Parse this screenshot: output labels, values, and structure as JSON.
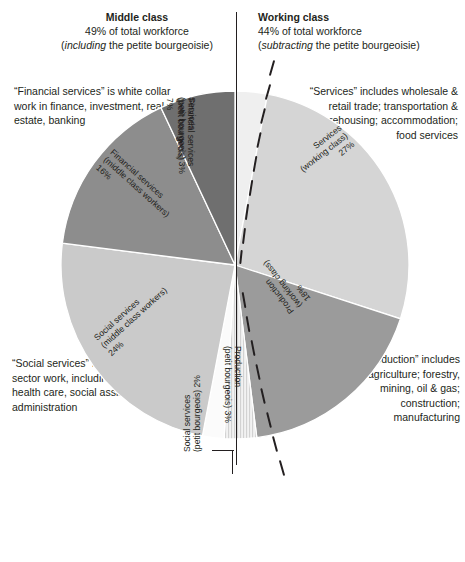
{
  "header": {
    "middle": {
      "title": "Middle class",
      "line2": "49% of total workforce",
      "line3_italic": "including",
      "line3_rest": " the petite bourgeoisie)",
      "line3_open": "("
    },
    "working": {
      "title": "Working class",
      "line2": "44% of total workforce",
      "line3_italic": "subtracting",
      "line3_rest": " the petite bourgeoisie)",
      "line3_open": "("
    }
  },
  "notes": {
    "financial": "“Financial services” is white collar work in finance, investment, real estate, banking",
    "services": "“Services” includes wholesale & retail trade; transportation & warehousing; accommodation; food services",
    "social": "“Social services” is mostly public sector work, including teaching, health care, social assistance, public administration",
    "production": "“Production” includes agriculture; forestry, mining, oil & gas; construction; manufacturing"
  },
  "chart_data": {
    "type": "pie",
    "title": "",
    "legend": "none",
    "total_label": "% of total workforce",
    "slices": [
      {
        "key": "services_pb",
        "name": "Services",
        "group": "(petit bourgeois)",
        "value": 3,
        "label": "Services\n(petit bourgeois) 3%",
        "color": "#efefef"
      },
      {
        "key": "services_wc",
        "name": "Services",
        "group": "(working class)",
        "value": 27,
        "label": "Services\n(working class)\n27%",
        "color": "#d5d5d5"
      },
      {
        "key": "production_wc",
        "name": "Production",
        "group": "(working class)",
        "value": 18,
        "label": "Production\n(working class)\n18%",
        "color": "#9b9b9b"
      },
      {
        "key": "production_pb",
        "name": "Production",
        "group": "(petit bourgeois)",
        "value": 3,
        "label": "Production\n(petit bourgeois) 3%",
        "color": "#ededed"
      },
      {
        "key": "social_pb",
        "name": "Social services",
        "group": "(petit bourgeois)",
        "value": 2,
        "label": "Social services\n(petit bourgeois) 2%",
        "color": "#fbfbfb"
      },
      {
        "key": "social_mc",
        "name": "Social services",
        "group": "(middle class workers)",
        "value": 24,
        "label": "Social services\n(middle class workers)\n24%",
        "color": "#cacaca"
      },
      {
        "key": "financial_mc",
        "name": "Financial services",
        "group": "(middle class workers)",
        "value": 16,
        "label": "Financial services\n(middle class workers)\n16%",
        "color": "#8d8d8d"
      },
      {
        "key": "financial_pb",
        "name": "Financial services",
        "group": "(petit bourgeois)",
        "value": 7,
        "label": "Financial services\n(petit bourgeois)\n7%",
        "color": "#6f6f6f"
      }
    ],
    "class_groups": [
      {
        "name": "Middle class",
        "percent": 49,
        "qualifier": "including the petite bourgeoisie"
      },
      {
        "name": "Working class",
        "percent": 44,
        "qualifier": "subtracting the petite bourgeoisie"
      }
    ]
  },
  "labels": {
    "services_pb": "Services\n(petit bourgeois) 3%",
    "services_wc": "Services\n(working class)\n27%",
    "production_wc": "Production\n(working class)\n18%",
    "production_pb": "Production\n(petit bourgeois) 3%",
    "social_pb": "Social services\n(petit bourgeois) 2%",
    "social_mc": "Social services\n(middle class workers)\n24%",
    "financial_mc": "Financial services\n(middle class workers)\n16%",
    "financial_pb": "Financial services\n(petit bourgeois)\n7%"
  }
}
